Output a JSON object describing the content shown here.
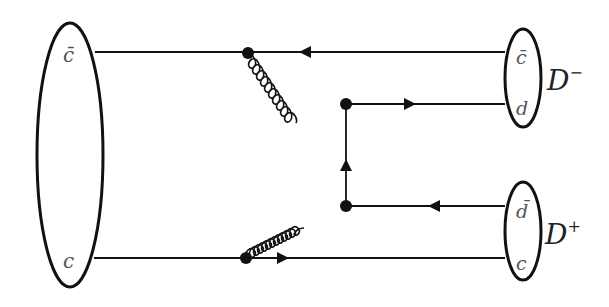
{
  "diagram": {
    "type": "feynman-diagram",
    "initial_state": {
      "quarks": [
        {
          "label": "c̄",
          "position": "top"
        },
        {
          "label": "c",
          "position": "bottom"
        }
      ]
    },
    "final_states": [
      {
        "meson": "D",
        "charge": "−",
        "quarks": [
          {
            "label": "c̄",
            "position": "top"
          },
          {
            "label": "d",
            "position": "bottom"
          }
        ]
      },
      {
        "meson": "D",
        "charge": "+",
        "quarks": [
          {
            "label": "d̄",
            "position": "top"
          },
          {
            "label": "c",
            "position": "bottom"
          }
        ]
      }
    ],
    "propagators": [
      {
        "kind": "gluon",
        "from": "top-quark-line vertex",
        "to": "upper-right vertex"
      },
      {
        "kind": "gluon",
        "from": "bottom-quark-line vertex",
        "to": "lower-right vertex"
      },
      {
        "kind": "quark",
        "from": "lower-right vertex",
        "to": "upper-right vertex"
      }
    ],
    "colors": {
      "line": "#111111",
      "label": "#555555"
    }
  }
}
